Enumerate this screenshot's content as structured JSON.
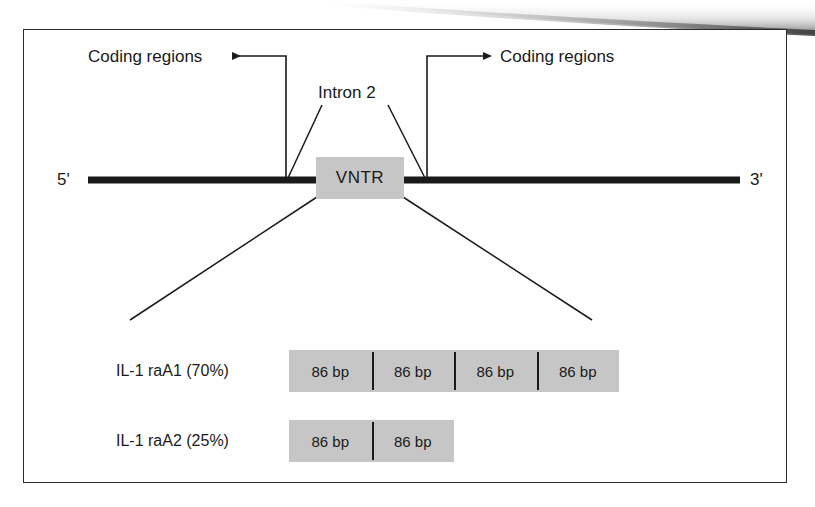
{
  "figure": {
    "backbone": {
      "five_prime_label": "5'",
      "three_prime_label": "3'"
    },
    "annotations": {
      "coding_left_label": "Coding regions",
      "coding_right_label": "Coding regions",
      "intron_label": "Intron 2",
      "vntr_label": "VNTR"
    },
    "alleles": [
      {
        "name": "IL-1 raA1 (70%)",
        "repeat_count": 4,
        "repeats": [
          "86 bp",
          "86 bp",
          "86 bp",
          "86 bp"
        ]
      },
      {
        "name": "IL-1 raA2 (25%)",
        "repeat_count": 2,
        "repeats": [
          "86 bp",
          "86 bp"
        ]
      }
    ],
    "colors": {
      "box_fill": "#c6c6c6",
      "line": "#1a1a1a",
      "frame": "#2b2b2b",
      "background": "#ffffff"
    }
  }
}
